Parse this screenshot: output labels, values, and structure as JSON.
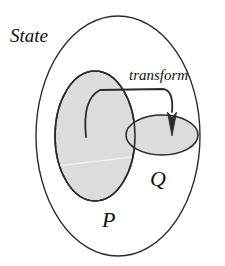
{
  "figure": {
    "title_label": "State",
    "type": "set-diagram",
    "background_color": "#ffffff",
    "stroke_color": "#2b2b2b",
    "fill_color": "#dcdcdc"
  },
  "labels": {
    "state": "State",
    "transform": "transform",
    "p": "P",
    "q": "Q"
  },
  "shapes": {
    "outer_ellipse": {
      "name": "State",
      "cx": 118,
      "cy": 136,
      "rx": 82,
      "ry": 120,
      "filled": false
    },
    "set_p": {
      "name": "P",
      "cx": 95,
      "cy": 136,
      "rx": 40,
      "ry": 65,
      "filled": true
    },
    "set_q": {
      "name": "Q",
      "cx": 162,
      "cy": 135,
      "rx": 36,
      "ry": 20,
      "filled": true
    }
  },
  "arrow": {
    "label": "transform",
    "from_set": "P",
    "to_set": "Q",
    "tail_x": 86,
    "tail_y": 137,
    "head_x": 172,
    "head_y": 134
  }
}
